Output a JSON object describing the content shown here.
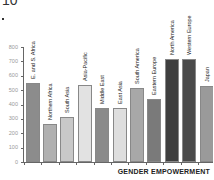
{
  "chart_data": {
    "type": "bar",
    "title_fragment": "10",
    "xlabel": "GENDER EMPOWERMENT",
    "ylabel": "",
    "ylim": [
      0,
      800
    ],
    "yticks": [
      0,
      100,
      200,
      300,
      400,
      500,
      600,
      700,
      800
    ],
    "grid": false,
    "legend": null,
    "categories": [
      "E. and S. Africa",
      "Northern Africa",
      "South Asia",
      "Asia-Pacific",
      "Middle East",
      "East Asia",
      "South America",
      "Eastern Europe",
      "North America",
      "Western Europe",
      "Japan"
    ],
    "values": [
      550,
      265,
      315,
      535,
      378,
      378,
      513,
      438,
      718,
      718,
      530
    ],
    "colors": [
      "#8c8c8c",
      "#b0b0b0",
      "#c8c8c8",
      "#e2e2e2",
      "#8a8a8a",
      "#dedede",
      "#a8a8a8",
      "#7a7a7a",
      "#3f3f3f",
      "#4a4a4a",
      "#9a9a9a"
    ]
  }
}
